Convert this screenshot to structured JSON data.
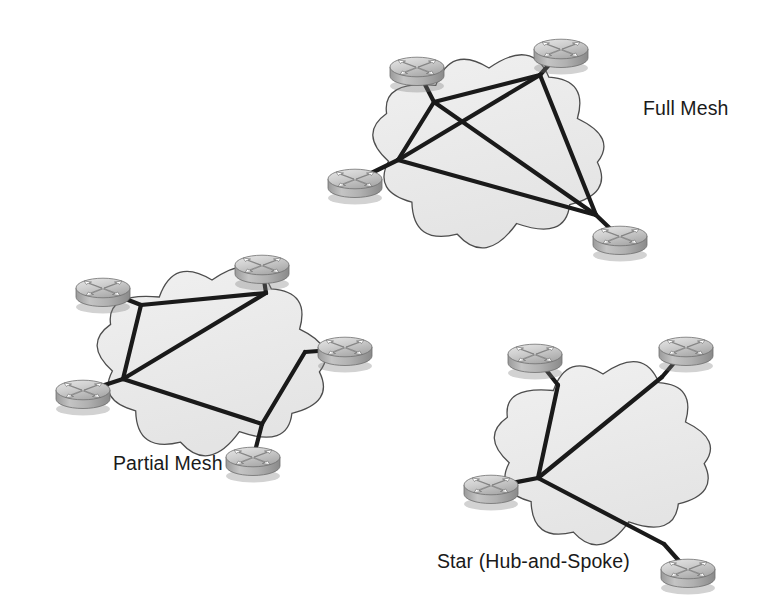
{
  "diagram": {
    "background_color": "#ffffff",
    "width": 772,
    "height": 603,
    "link_color": "#1a1a1a",
    "cloud_fill": "#ececec",
    "cloud_stroke": "#4d4d4d",
    "router_icon_name": "router-icon",
    "topologies": [
      {
        "id": "full-mesh",
        "label": "Full Mesh",
        "label_x": 643,
        "label_y": 115,
        "cloud": {
          "cx": 489,
          "cy": 150,
          "rx": 105,
          "ry": 82
        },
        "routers": [
          {
            "name": "full-mesh-router-top-left",
            "x": 417,
            "y": 69
          },
          {
            "name": "full-mesh-router-top-right",
            "x": 561,
            "y": 51
          },
          {
            "name": "full-mesh-router-left",
            "x": 355,
            "y": 181
          },
          {
            "name": "full-mesh-router-bottom-right",
            "x": 620,
            "y": 238
          }
        ],
        "nodes": [
          {
            "id": "n-tl",
            "x": 434,
            "y": 102
          },
          {
            "id": "n-tr",
            "x": 540,
            "y": 75
          },
          {
            "id": "n-l",
            "x": 398,
            "y": 160
          },
          {
            "id": "n-br",
            "x": 596,
            "y": 215
          }
        ],
        "links": [
          [
            "n-tl",
            "n-tr"
          ],
          [
            "n-tl",
            "n-l"
          ],
          [
            "n-tl",
            "n-br"
          ],
          [
            "n-tr",
            "n-l"
          ],
          [
            "n-tr",
            "n-br"
          ],
          [
            "n-l",
            "n-br"
          ]
        ],
        "stubs": [
          [
            "n-tl",
            "full-mesh-router-top-left"
          ],
          [
            "n-tr",
            "full-mesh-router-top-right"
          ],
          [
            "n-l",
            "full-mesh-router-left"
          ],
          [
            "n-br",
            "full-mesh-router-bottom-right"
          ]
        ]
      },
      {
        "id": "partial-mesh",
        "label": "Partial Mesh",
        "label_x": 113,
        "label_y": 470,
        "cloud": {
          "cx": 212,
          "cy": 360,
          "rx": 104,
          "ry": 80
        },
        "routers": [
          {
            "name": "partial-mesh-router-top-left",
            "x": 103,
            "y": 290
          },
          {
            "name": "partial-mesh-router-top-right",
            "x": 262,
            "y": 267
          },
          {
            "name": "partial-mesh-router-left",
            "x": 83,
            "y": 392
          },
          {
            "name": "partial-mesh-router-right",
            "x": 345,
            "y": 349
          },
          {
            "name": "partial-mesh-router-bottom-right",
            "x": 253,
            "y": 459
          }
        ],
        "nodes": [
          {
            "id": "p-tl",
            "x": 141,
            "y": 305
          },
          {
            "id": "p-tr",
            "x": 266,
            "y": 293
          },
          {
            "id": "p-l",
            "x": 123,
            "y": 379
          },
          {
            "id": "p-r",
            "x": 305,
            "y": 352
          },
          {
            "id": "p-br",
            "x": 262,
            "y": 424
          }
        ],
        "links": [
          [
            "p-tl",
            "p-tr"
          ],
          [
            "p-tl",
            "p-l"
          ],
          [
            "p-l",
            "p-tr"
          ],
          [
            "p-l",
            "p-br"
          ],
          [
            "p-br",
            "p-r"
          ]
        ],
        "stubs": [
          [
            "p-tl",
            "partial-mesh-router-top-left"
          ],
          [
            "p-tr",
            "partial-mesh-router-top-right"
          ],
          [
            "p-l",
            "partial-mesh-router-left"
          ],
          [
            "p-r",
            "partial-mesh-router-right"
          ],
          [
            "p-br",
            "partial-mesh-router-bottom-right"
          ]
        ]
      },
      {
        "id": "star",
        "label": "Star (Hub-and-Spoke)",
        "label_x": 437,
        "label_y": 568,
        "cloud": {
          "cx": 603,
          "cy": 452,
          "rx": 98,
          "ry": 78
        },
        "routers": [
          {
            "name": "star-router-spoke-top-left",
            "x": 535,
            "y": 356
          },
          {
            "name": "star-router-spoke-top-right",
            "x": 686,
            "y": 349
          },
          {
            "name": "star-router-hub",
            "x": 491,
            "y": 487
          },
          {
            "name": "star-router-spoke-bottom-right",
            "x": 688,
            "y": 571
          }
        ],
        "nodes": [
          {
            "id": "s-hub",
            "x": 538,
            "y": 478
          },
          {
            "id": "s-tl",
            "x": 558,
            "y": 385
          },
          {
            "id": "s-tr",
            "x": 662,
            "y": 377
          },
          {
            "id": "s-br",
            "x": 664,
            "y": 544
          }
        ],
        "links": [
          [
            "s-hub",
            "s-tl"
          ],
          [
            "s-hub",
            "s-tr"
          ],
          [
            "s-hub",
            "s-br"
          ]
        ],
        "stubs": [
          [
            "s-tl",
            "star-router-spoke-top-left"
          ],
          [
            "s-tr",
            "star-router-spoke-top-right"
          ],
          [
            "s-hub",
            "star-router-hub"
          ],
          [
            "s-br",
            "star-router-spoke-bottom-right"
          ]
        ]
      }
    ]
  }
}
